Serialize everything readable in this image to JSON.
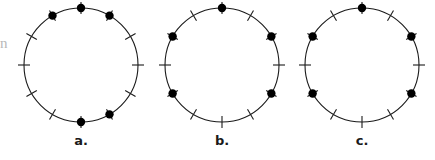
{
  "figure": {
    "type": "diagram",
    "background_color": "#ffffff",
    "stroke_color": "#1a1a1a",
    "dot_color": "#000000",
    "edge_artifact_text": "n"
  },
  "geometry": {
    "radius": 57,
    "tick_inner": 51,
    "tick_outer": 63,
    "dot_radius": 4.2,
    "circle_stroke_width": 1.1,
    "tick_stroke_width": 1.1,
    "center_y": 65,
    "label_y": 133,
    "tick_count": 12,
    "tick_hours": [
      12,
      1,
      2,
      3,
      4,
      5,
      6,
      7,
      8,
      9,
      10,
      11
    ]
  },
  "panels": [
    {
      "id": "panel-a",
      "label": "a.",
      "center_x": 81,
      "label_x": 81,
      "dot_hours": [
        11,
        12,
        1,
        5,
        6
      ],
      "dot_count": 5
    },
    {
      "id": "panel-b",
      "label": "b.",
      "center_x": 222,
      "label_x": 222,
      "dot_hours": [
        10,
        12,
        2,
        4,
        8
      ],
      "dot_count": 5
    },
    {
      "id": "panel-c",
      "label": "c.",
      "center_x": 362,
      "label_x": 362,
      "dot_hours": [
        10,
        12,
        2,
        4,
        8
      ],
      "dot_count": 5
    }
  ]
}
